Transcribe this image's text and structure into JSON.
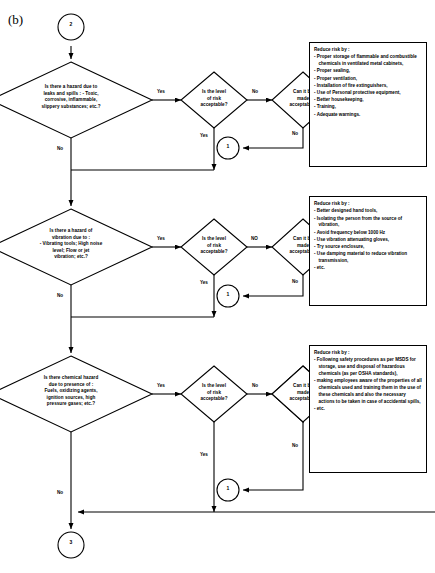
{
  "figure": {
    "label": "(b)"
  },
  "connectors": {
    "top": "2",
    "bottom": "3",
    "loop": "1"
  },
  "edge_labels": {
    "yes": "Yes",
    "no": "No",
    "no_caps": "NO"
  },
  "rows": [
    {
      "id": "hazard-leaks-spills",
      "question": "Is there a hazard due to leaks and spills : - Toxic, corrosive, inflammable, slippery substances; etc.?",
      "question_lines": [
        "Is there a hazard due to",
        "leaks and spills : - Toxic,",
        "corrosive, inflammable,",
        "slippery substances; etc.?"
      ],
      "risk_level_question_lines": [
        "Is the level",
        "of risk",
        "acceptable?"
      ],
      "can_be_made_question_lines": [
        "Can it be",
        "made",
        "acceptable?"
      ],
      "branch_to_risk": "Yes",
      "branch_risk_to_made": "No",
      "branch_made_to_action": "Yes",
      "branch_risk_down": "Yes",
      "branch_made_down": "No",
      "branch_question_down": "No",
      "action": {
        "title": "Reduce risk by :",
        "items": [
          "Proper storage of flammable and combustible chemicals in ventilated metal cabinets,",
          "Proper sealing,",
          "Proper ventilation,",
          "Installation of fire extinguishers,",
          "Use of Personal protective equipment,",
          "Better housekeeping,",
          "Training,",
          "Adequate warnings."
        ]
      }
    },
    {
      "id": "hazard-vibration",
      "question": "Is there a hazard of vibration due to : - Vibrating tools; High noise level; Flow or jet vibration; etc.?",
      "question_lines": [
        "Is there a hazard of",
        "vibration due to :",
        "-  Vibrating tools; High noise",
        "level; Flow or jet",
        "vibration; etc.?"
      ],
      "risk_level_question_lines": [
        "Is the level",
        "of risk",
        "acceptable?"
      ],
      "can_be_made_question_lines": [
        "Can it be",
        "made",
        "acceptable?"
      ],
      "branch_to_risk": "Yes",
      "branch_risk_to_made": "NO",
      "branch_made_to_action": "Yes",
      "branch_risk_down": "Yes",
      "branch_made_down": "No",
      "branch_question_down": "No",
      "action": {
        "title": "Reduce risk by :",
        "items": [
          "Better designed hand tools,",
          "Isolating the person from the source of vibration,",
          "Avoid frequency below 1000  Hz",
          "Use vibration attenuating gloves,",
          "Try source enclosure,",
          "Use damping material to reduce vibration transmission,",
          "etc."
        ]
      }
    },
    {
      "id": "chemical-hazard",
      "question": "Is there chemical hazard due to presence of : Fuels, oxidizing agents, ignition sources, high pressure gases; etc.?",
      "question_lines": [
        "Is there chemical hazard",
        "due  to presence of :",
        "Fuels, oxidizing agents,",
        "ignition sources, high",
        "pressure gases; etc.?"
      ],
      "risk_level_question_lines": [
        "Is the level",
        "of risk",
        "acceptable?"
      ],
      "can_be_made_question_lines": [
        "Can it be",
        "made",
        "acceptable?"
      ],
      "branch_to_risk": "Yes",
      "branch_risk_to_made": "No",
      "branch_made_to_action": "Yes",
      "branch_risk_down": "Yes",
      "branch_made_down": "No",
      "branch_question_down": "No",
      "action": {
        "title": "Reduce risk by :",
        "items": [
          "Following safety procedures as per MSDS for storage,  use and disposal of hazardous chemicals (as per OSHA standards),",
          "making employees aware of the properties of all chemicals used and training them in the use of these chemicals and also the necessary actions to be taken in case of accidental spills,",
          "etc."
        ]
      }
    }
  ],
  "colors": {
    "line": "#000000",
    "background": "#ffffff",
    "text": "#000000"
  }
}
